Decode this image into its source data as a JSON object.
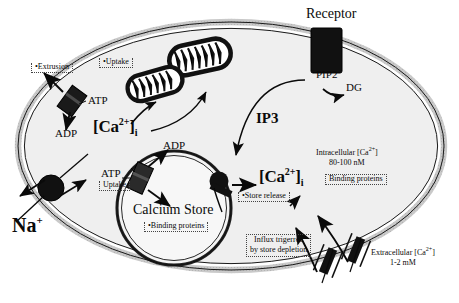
{
  "figure": {
    "type": "cell-biology-schematic"
  },
  "colors": {
    "membrane_fill": "#c9c9c9",
    "membrane_stroke": "#1a1a1a",
    "cytoplasm_fill": "#efefef",
    "protein_dark": "#111111",
    "store_fill": "#f4f4f4",
    "text": "#0a0a0a",
    "dotted_box": "#444444"
  },
  "labels": {
    "receptor": "Receptor",
    "pip2": "PIP2",
    "dg": "DG",
    "ip3": "IP3",
    "extrusion": "•Extrusion",
    "atp_pmca": "ATP",
    "adp_pmca": "ADP",
    "sodium": "Na",
    "sodium_charge": "+",
    "uptake_mito": "•Uptake",
    "uptake_serca": "Uptake",
    "atp_serca": "ATP",
    "adp_serca": "ADP",
    "calcium_store": "Calcium Store",
    "binding_proteins_store": "•Binding proteins",
    "store_release": "•Store release",
    "influx_line1": "Influx trigerred",
    "influx_line2": "by store depletion",
    "intracellular_line1": "Intracellular [Ca",
    "intracellular_sup": "2+",
    "intracellular_line1_end": "]",
    "intracellular_line2": "80-100 nM",
    "binding_proteins_cyto": "Binding proteins",
    "extracellular_line1": "Extracellular [Ca",
    "extracellular_sup": "2+",
    "extracellular_line1_end": "]",
    "extracellular_line2": "1-2 mM",
    "ca_cyto_main": "[Ca",
    "ca_cyto_sup": "2+",
    "ca_cyto_close": "]",
    "ca_cyto_sub": "i"
  },
  "structures": [
    {
      "name": "plasma-membrane",
      "shape": "ellipse",
      "note": "gray double-walled band"
    },
    {
      "name": "pmca-pump",
      "note": "ATP-driven calcium extrusion pump, upper left membrane"
    },
    {
      "name": "sodium-calcium-exchanger",
      "note": "black circle, left membrane"
    },
    {
      "name": "serca-pump",
      "note": "ATP-driven uptake pump on calcium store"
    },
    {
      "name": "ip3-receptor",
      "note": "black blob on store, right side, store release"
    },
    {
      "name": "mitochondrion-upper",
      "note": "calcium uptake organelle"
    },
    {
      "name": "mitochondrion-lower",
      "note": "calcium uptake organelle"
    },
    {
      "name": "membrane-receptor",
      "note": "black rectangle spanning membrane at top"
    },
    {
      "name": "soc-channel-left",
      "note": "store-operated calcium channel, bottom membrane"
    },
    {
      "name": "soc-channel-right",
      "note": "store-operated calcium channel, bottom membrane"
    },
    {
      "name": "calcium-store",
      "shape": "circle",
      "note": "internal calcium store / ER"
    }
  ]
}
